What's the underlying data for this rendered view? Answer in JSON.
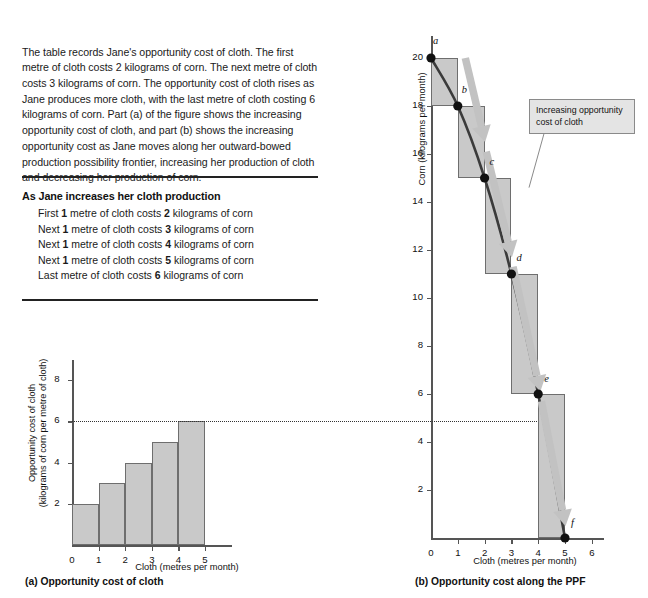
{
  "figure": {
    "intro_paragraph": "The table records Jane's opportunity cost of cloth.  The first metre of cloth costs 2 kilograms of corn.  The next metre of cloth costs 3 kilograms of corn.  The opportunity cost of cloth rises as Jane produces more cloth, with the last metre of cloth costing 6 kilograms of corn.  Part (a) of the figure shows the increasing opportunity cost of cloth, and part (b) shows the increasing opportunity cost as Jane moves along her outward-bowed production possibility frontier, increasing her production of cloth and decreasing her production of corn."
  },
  "cost_table": {
    "heading": "As Jane increases her cloth production",
    "rows": [
      {
        "order": "First",
        "qty": "1",
        "mid": "metre of cloth costs",
        "cost": "2",
        "unit": "kilograms of corn"
      },
      {
        "order": "Next",
        "qty": "1",
        "mid": "metre of cloth costs",
        "cost": "3",
        "unit": "kilograms of corn"
      },
      {
        "order": "Next",
        "qty": "1",
        "mid": "metre of cloth costs",
        "cost": "4",
        "unit": "kilograms of corn"
      },
      {
        "order": "Next",
        "qty": "1",
        "mid": "metre of cloth costs",
        "cost": "5",
        "unit": "kilograms of corn"
      },
      {
        "order": "Last",
        "qty": "",
        "mid": "metre of cloth costs",
        "cost": "6",
        "unit": "kilograms of corn"
      }
    ]
  },
  "captions": {
    "a": "(a) Opportunity cost of cloth",
    "b": "(b) Opportunity cost along the PPF"
  },
  "annotation": {
    "callout_line1": "Increasing opportunity",
    "callout_line2": "cost of cloth"
  },
  "colors": {
    "fill_gray": "#c9c9c9",
    "stroke_gray": "#6e6e6e",
    "arrow_gray": "#c2c2c2",
    "curve_dark": "#3b3b3b",
    "axis": "#555555",
    "point": "#111111"
  },
  "chart_data": [
    {
      "type": "bar",
      "title": "(a) Opportunity cost of cloth",
      "xlabel": "Cloth (metres per month)",
      "ylabel": "Opportunity cost of cloth (kilograms of corn per metre of cloth)",
      "ylabel_line1": "Opportunity cost of cloth",
      "ylabel_line2": "(kilograms of corn per metre of cloth)",
      "categories": [
        "0–1",
        "1–2",
        "2–3",
        "3–4",
        "4–5"
      ],
      "bar_starts": [
        0,
        1,
        2,
        3,
        4
      ],
      "bar_ends": [
        1,
        2,
        3,
        4,
        5
      ],
      "values": [
        2,
        3,
        4,
        5,
        6
      ],
      "xticks": [
        "0",
        "1",
        "2",
        "3",
        "4",
        "5"
      ],
      "xtick_values": [
        0,
        1,
        2,
        3,
        4,
        5
      ],
      "yticks": [
        "2",
        "4",
        "6",
        "8"
      ],
      "ytick_values": [
        2,
        4,
        6,
        8
      ],
      "xlim": [
        0,
        6
      ],
      "ylim": [
        0,
        9
      ],
      "grid": false,
      "reference_line": {
        "y": 6,
        "style": "dotted",
        "note": "extends across to part (b)"
      }
    },
    {
      "type": "line",
      "title": "(b) Opportunity cost along the PPF",
      "xlabel": "Cloth (metres per month)",
      "ylabel": "Corn (kilograms per month)",
      "series": [
        {
          "name": "Production possibility frontier",
          "points": [
            {
              "label": "a",
              "x": 0,
              "y": 20
            },
            {
              "label": "b",
              "x": 1,
              "y": 18
            },
            {
              "label": "c",
              "x": 2,
              "y": 15
            },
            {
              "label": "d",
              "x": 3,
              "y": 11
            },
            {
              "label": "e",
              "x": 4,
              "y": 6
            },
            {
              "label": "f",
              "x": 5,
              "y": 0
            }
          ]
        }
      ],
      "step_rectangles": [
        {
          "x0": 0,
          "x1": 1,
          "y0": 18,
          "y1": 20,
          "cost": 2
        },
        {
          "x0": 1,
          "x1": 2,
          "y0": 15,
          "y1": 18,
          "cost": 3
        },
        {
          "x0": 2,
          "x1": 3,
          "y0": 11,
          "y1": 15,
          "cost": 4
        },
        {
          "x0": 3,
          "x1": 4,
          "y0": 6,
          "y1": 11,
          "cost": 5
        },
        {
          "x0": 4,
          "x1": 5,
          "y0": 0,
          "y1": 6,
          "cost": 6
        }
      ],
      "xticks": [
        "0",
        "1",
        "2",
        "3",
        "4",
        "5",
        "6"
      ],
      "xtick_values": [
        0,
        1,
        2,
        3,
        4,
        5,
        6
      ],
      "yticks": [
        "2",
        "4",
        "6",
        "8",
        "10",
        "12",
        "14",
        "16",
        "18",
        "20"
      ],
      "ytick_values": [
        2,
        4,
        6,
        8,
        10,
        12,
        14,
        16,
        18,
        20
      ],
      "xlim": [
        0,
        6.4
      ],
      "ylim": [
        0,
        21
      ],
      "grid": false,
      "annotations": [
        {
          "text": "Increasing opportunity cost of cloth",
          "type": "callout"
        }
      ],
      "reference_line": {
        "y": 6,
        "style": "dotted"
      }
    }
  ]
}
